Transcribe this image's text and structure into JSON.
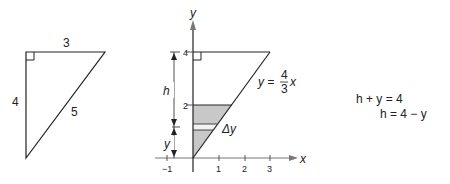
{
  "left_triangle": {
    "side_top": "3",
    "side_left": "4",
    "hypotenuse": "5",
    "right_angle": "top-left"
  },
  "graph": {
    "x_axis_label": "x",
    "y_axis_label": "y",
    "x_ticks": [
      "−1",
      "1",
      "2",
      "3"
    ],
    "y_ticks": [
      "2",
      "4"
    ],
    "line_label_lhs": "y =",
    "line_frac_num": "4",
    "line_frac_den": "3",
    "line_label_rhs": "x",
    "h_label": "h",
    "y_label": "y",
    "dy_label": "Δy",
    "shade_color": "#c8c8c8"
  },
  "equations": {
    "line1": "h + y = 4",
    "line2": "h = 4 − y"
  }
}
